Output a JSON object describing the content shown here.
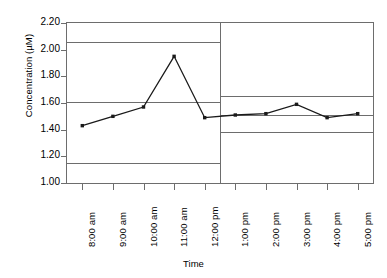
{
  "chart_data": {
    "type": "line",
    "title": "",
    "xlabel": "Time",
    "ylabel": "Concentration (µM)",
    "ylim": [
      1.0,
      2.2
    ],
    "yticks": [
      "1.00",
      "1.20",
      "1.40",
      "1.60",
      "1.80",
      "2.00",
      "2.20"
    ],
    "ytick_values": [
      1.0,
      1.2,
      1.4,
      1.6,
      1.8,
      2.0,
      2.2
    ],
    "grid": false,
    "legend": "none",
    "categories": [
      "8:00 am",
      "9:00 am",
      "10:00 am",
      "11:00 am",
      "12:00 pm",
      "1:00 pm",
      "2:00 pm",
      "3:00 pm",
      "4:00 pm",
      "5:00 pm"
    ],
    "values": [
      1.43,
      1.5,
      1.57,
      1.95,
      1.49,
      1.51,
      1.52,
      1.59,
      1.49,
      1.52
    ],
    "series": [
      {
        "name": "Concentration",
        "values": [
          1.43,
          1.5,
          1.57,
          1.95,
          1.49,
          1.51,
          1.52,
          1.59,
          1.49,
          1.52
        ],
        "marker": "square",
        "color": "#1a1a1a"
      }
    ],
    "reference_lines": [
      {
        "label": "upper control limit (segment 1)",
        "value": 2.06,
        "segment": "left",
        "color": "#6d6d6d"
      },
      {
        "label": "center line (segment 1)",
        "value": 1.61,
        "segment": "left",
        "color": "#6d6d6d"
      },
      {
        "label": "lower control limit (segment 1)",
        "value": 1.15,
        "segment": "left",
        "color": "#6d6d6d"
      },
      {
        "label": "upper control limit (segment 2)",
        "value": 1.65,
        "segment": "right",
        "color": "#6d6d6d"
      },
      {
        "label": "center line (segment 2)",
        "value": 1.51,
        "segment": "right",
        "color": "#6d6d6d"
      },
      {
        "label": "lower control limit (segment 2)",
        "value": 1.38,
        "segment": "right",
        "color": "#6d6d6d"
      }
    ],
    "divider_after_category": "11:00 am",
    "axis_color": "#6d6d6d",
    "background": "#ffffff"
  }
}
